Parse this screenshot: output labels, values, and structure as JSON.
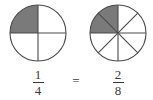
{
  "figure": {
    "background_color": "#ffffff",
    "stroke_color": "#4a4a4a",
    "shade_color": "#7a7a7a",
    "text_color": "#3a3a3a"
  },
  "left_model": {
    "name": "quarter-circle-model",
    "center_x": 38,
    "center_y": 33,
    "radius": 28,
    "total_parts": 4,
    "shaded_parts": 1,
    "shaded_sector_indices": [
      2
    ],
    "divider_count": 2,
    "fill_color": "#7a7a7a",
    "stroke_color": "#4a4a4a"
  },
  "right_model": {
    "name": "eighth-circle-model",
    "center_x": 118,
    "center_y": 33,
    "radius": 28,
    "total_parts": 8,
    "shaded_parts": 2,
    "shaded_sector_indices": [
      4,
      5
    ],
    "divider_count": 4,
    "fill_color": "#7a7a7a",
    "stroke_color": "#4a4a4a"
  },
  "left_fraction": {
    "numerator": "1",
    "denominator": "4",
    "spoken": "one fourth"
  },
  "right_fraction": {
    "numerator": "2",
    "denominator": "8",
    "spoken": "two eighths"
  },
  "relation": {
    "symbol": "=",
    "spoken": "equals"
  }
}
